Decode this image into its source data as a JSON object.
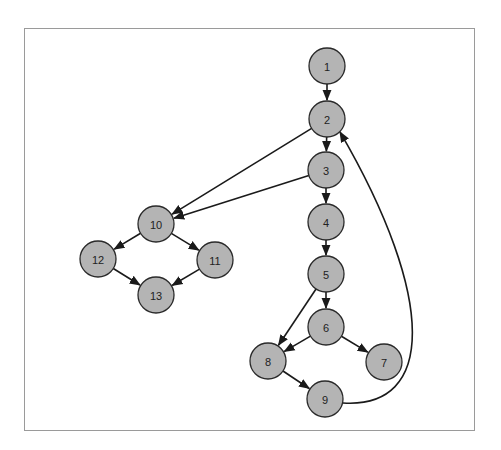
{
  "diagram": {
    "type": "control-flow-graph",
    "node_fill": "#b4b4b4",
    "node_stroke": "#2a2a2a",
    "edge_color": "#1a1a1a",
    "frame_border": "#9a9a9a",
    "nodes": [
      {
        "id": "1",
        "label": "1",
        "x": 327,
        "y": 66
      },
      {
        "id": "2",
        "label": "2",
        "x": 327,
        "y": 119
      },
      {
        "id": "3",
        "label": "3",
        "x": 326,
        "y": 170
      },
      {
        "id": "4",
        "label": "4",
        "x": 326,
        "y": 222
      },
      {
        "id": "5",
        "label": "5",
        "x": 326,
        "y": 274
      },
      {
        "id": "6",
        "label": "6",
        "x": 326,
        "y": 327
      },
      {
        "id": "7",
        "label": "7",
        "x": 384,
        "y": 362
      },
      {
        "id": "8",
        "label": "8",
        "x": 268,
        "y": 361
      },
      {
        "id": "9",
        "label": "9",
        "x": 325,
        "y": 399
      },
      {
        "id": "10",
        "label": "10",
        "x": 156,
        "y": 224
      },
      {
        "id": "11",
        "label": "11",
        "x": 215,
        "y": 260
      },
      {
        "id": "12",
        "label": "12",
        "x": 98,
        "y": 259
      },
      {
        "id": "13",
        "label": "13",
        "x": 156,
        "y": 295
      }
    ],
    "edges": [
      {
        "from": "1",
        "to": "2"
      },
      {
        "from": "2",
        "to": "3"
      },
      {
        "from": "2",
        "to": "10"
      },
      {
        "from": "3",
        "to": "4"
      },
      {
        "from": "3",
        "to": "10"
      },
      {
        "from": "4",
        "to": "5"
      },
      {
        "from": "5",
        "to": "6"
      },
      {
        "from": "5",
        "to": "8"
      },
      {
        "from": "6",
        "to": "8"
      },
      {
        "from": "6",
        "to": "7"
      },
      {
        "from": "8",
        "to": "9"
      },
      {
        "from": "9",
        "to": "2",
        "curved": true
      },
      {
        "from": "10",
        "to": "12"
      },
      {
        "from": "10",
        "to": "11"
      },
      {
        "from": "12",
        "to": "13"
      },
      {
        "from": "11",
        "to": "13"
      }
    ]
  }
}
